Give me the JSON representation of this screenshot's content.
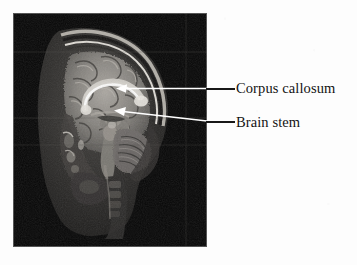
{
  "figure": {
    "background_color": "#fdfdfd"
  },
  "mri_panel": {
    "name": "sagittal-mri-scan",
    "description": "Mid-sagittal T1-weighted magnetic resonance image of a human head",
    "background_color": "#060606",
    "x": 13,
    "y": 13,
    "width": 194,
    "height": 234,
    "scan_artifacts": {
      "horizontal_lines_y": [
        52,
        118,
        145
      ],
      "vertical_line_x": 186
    }
  },
  "annotations": [
    {
      "id": "corpus-callosum",
      "label": "Corpus callosum",
      "label_color": "#131313",
      "leader_line_color": "#181818",
      "arrow_color": "#ffffff",
      "arrow_tip": {
        "x": 117,
        "y": 88
      },
      "arrow_tail": {
        "x": 206,
        "y": 88
      },
      "label_position": {
        "x": 236,
        "y": 81
      }
    },
    {
      "id": "brain-stem",
      "label": "Brain stem",
      "label_color": "#131313",
      "leader_line_color": "#181818",
      "arrow_color": "#ffffff",
      "arrow_tip": {
        "x": 115,
        "y": 110
      },
      "arrow_tail": {
        "x": 206,
        "y": 121
      },
      "label_position": {
        "x": 236,
        "y": 115
      }
    }
  ]
}
